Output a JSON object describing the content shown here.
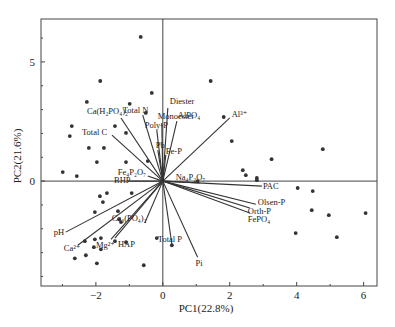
{
  "chart_data": {
    "type": "scatter",
    "subtype": "pca-biplot",
    "title": "",
    "xlabel": "PC1(22.8%)",
    "ylabel": "PC2(21.6%)",
    "xlim": [
      -3.64,
      6.4
    ],
    "ylim": [
      -4.4,
      6.8
    ],
    "x_ticks": [
      -2,
      0,
      2,
      4,
      6
    ],
    "y_ticks": [
      0,
      5
    ],
    "grid": false,
    "legend": "none",
    "reference_lines": {
      "x": 0,
      "y": 0
    },
    "points": [
      [
        -0.66,
        6.05
      ],
      [
        -1.87,
        4.2
      ],
      [
        -0.33,
        3.7
      ],
      [
        -2.27,
        3.32
      ],
      [
        -0.99,
        3.24
      ],
      [
        -2.72,
        2.31
      ],
      [
        -2.78,
        1.89
      ],
      [
        -1.43,
        2.31
      ],
      [
        -0.51,
        2.86
      ],
      [
        -2.21,
        1.39
      ],
      [
        -1.76,
        1.39
      ],
      [
        -1.97,
        0.8
      ],
      [
        -1.1,
        0.8
      ],
      [
        -2.99,
        0.38
      ],
      [
        -2.57,
        0.21
      ],
      [
        -1.1,
        2.02
      ],
      [
        -0.45,
        0.84
      ],
      [
        1.43,
        4.2
      ],
      [
        1.82,
        2.69
      ],
      [
        2.06,
        1.68
      ],
      [
        3.25,
        0.92
      ],
      [
        4.78,
        1.34
      ],
      [
        2.39,
        0.46
      ],
      [
        2.48,
        0.25
      ],
      [
        2.81,
        0.13
      ],
      [
        2.81,
        0.04
      ],
      [
        1.04,
        0.0
      ],
      [
        -1.88,
        -0.63
      ],
      [
        -1.67,
        -0.5
      ],
      [
        -1.79,
        -0.88
      ],
      [
        -0.93,
        -0.5
      ],
      [
        -2.03,
        -1.3
      ],
      [
        -1.34,
        -1.26
      ],
      [
        -1.31,
        -1.6
      ],
      [
        -1.25,
        -1.72
      ],
      [
        -2.33,
        -2.52
      ],
      [
        -2.03,
        -2.44
      ],
      [
        -1.85,
        -2.39
      ],
      [
        -2.06,
        -2.77
      ],
      [
        -1.85,
        -2.86
      ],
      [
        -1.43,
        -2.52
      ],
      [
        -1.1,
        -2.56
      ],
      [
        -2.63,
        -3.24
      ],
      [
        -2.3,
        -3.11
      ],
      [
        -1.97,
        -3.45
      ],
      [
        -0.57,
        -3.53
      ],
      [
        -0.18,
        -2.39
      ],
      [
        4.03,
        -0.29
      ],
      [
        4.48,
        -0.42
      ],
      [
        4.45,
        -1.22
      ],
      [
        4.96,
        -1.43
      ],
      [
        6.06,
        -1.34
      ],
      [
        3.97,
        -2.18
      ],
      [
        5.2,
        -2.35
      ],
      [
        0.27,
        -2.69
      ]
    ],
    "loadings": [
      {
        "label": "Diester",
        "x": 0.15,
        "y": 3.07
      },
      {
        "label": "Monoester",
        "x": -0.03,
        "y": 2.44
      },
      {
        "label": "Poly-P",
        "x": -0.18,
        "y": 2.14
      },
      {
        "label": "Total N",
        "x": -0.6,
        "y": 2.77
      },
      {
        "label": "Ca(H₂PO₄)₂",
        "x": -1.25,
        "y": 2.65
      },
      {
        "label": "Total C",
        "x": -1.52,
        "y": 1.93
      },
      {
        "label": "AlPO₄",
        "x": 0.42,
        "y": 2.52
      },
      {
        "label": "Pb",
        "x": -0.15,
        "y": 1.3
      },
      {
        "label": "Fe-P",
        "x": 0.09,
        "y": 1.1
      },
      {
        "label": "Al³⁺",
        "x": 2.0,
        "y": 2.65
      },
      {
        "label": "Fe₄P₂O₇",
        "x": -0.45,
        "y": 0.21
      },
      {
        "label": "BHP",
        "x": -1.04,
        "y": 0.0
      },
      {
        "label": "Na₄P₂O₇",
        "x": 1.1,
        "y": -0.08
      },
      {
        "label": "PAC",
        "x": 2.96,
        "y": -0.21
      },
      {
        "label": "Olsen-P",
        "x": 2.78,
        "y": -0.97
      },
      {
        "label": "Orth-P",
        "x": 2.6,
        "y": -1.13
      },
      {
        "label": "FePO₄",
        "x": 2.6,
        "y": -1.34
      },
      {
        "label": "Pi",
        "x": 1.04,
        "y": -3.19
      },
      {
        "label": "Total P",
        "x": 0.27,
        "y": -2.65
      },
      {
        "label": "HAP",
        "x": -1.43,
        "y": -2.39
      },
      {
        "label": "Mg²⁺",
        "x": -1.55,
        "y": -2.44
      },
      {
        "label": "Ca₃(PO₄)₂",
        "x": -0.54,
        "y": -1.76
      },
      {
        "label": "pH",
        "x": -2.9,
        "y": -2.14
      },
      {
        "label": "Ca²⁺",
        "x": -2.54,
        "y": -2.69
      }
    ]
  },
  "labels_layout": {
    "Diester": {
      "dx": 2,
      "dy": -4,
      "anchor": "start"
    },
    "Monoester": {
      "dx": -4,
      "dy": -4,
      "anchor": "start"
    },
    "Poly-P": {
      "dx": -12,
      "dy": -2,
      "anchor": "start"
    },
    "Total N": {
      "dx": -20,
      "dy": -2,
      "anchor": "start"
    },
    "Ca(H₂PO₄)₂": {
      "dx": -34,
      "dy": -4,
      "anchor": "start"
    },
    "Total C": {
      "dx": -30,
      "dy": 0,
      "anchor": "start"
    },
    "AlPO₄": {
      "dx": 1,
      "dy": -3,
      "anchor": "start"
    },
    "Pb": {
      "dx": -2,
      "dy": -2,
      "anchor": "start"
    },
    "Fe-P": {
      "dx": 0,
      "dy": -1,
      "anchor": "start"
    },
    "Al³⁺": {
      "dx": 2,
      "dy": -1,
      "anchor": "start"
    },
    "Fe₄P₂O₇": {
      "dx": -30,
      "dy": -1,
      "anchor": "start"
    },
    "BHP": {
      "dx": -14,
      "dy": 2,
      "anchor": "start"
    },
    "Na₄P₂O₇": {
      "dx": -24,
      "dy": -3,
      "anchor": "start"
    },
    "PAC": {
      "dx": 1,
      "dy": 3,
      "anchor": "start"
    },
    "Olsen-P": {
      "dx": 2,
      "dy": 1,
      "anchor": "start"
    },
    "Orth-P": {
      "dx": -2,
      "dy": 6,
      "anchor": "start"
    },
    "FePO₄": {
      "dx": -2,
      "dy": 9,
      "anchor": "start"
    },
    "Pi": {
      "dx": -2,
      "dy": 9,
      "anchor": "start"
    },
    "Total P": {
      "dx": -14,
      "dy": -2,
      "anchor": "start"
    },
    "HAP": {
      "dx": 3,
      "dy": 9,
      "anchor": "start"
    },
    "Mg²⁺": {
      "dx": -15,
      "dy": 9,
      "anchor": "start"
    },
    "Ca₃(PO₄)₂": {
      "dx": -33,
      "dy": -2,
      "anchor": "start"
    },
    "pH": {
      "dx": -12,
      "dy": 3,
      "anchor": "start"
    },
    "Ca²⁺": {
      "dx": -14,
      "dy": 6,
      "anchor": "start"
    }
  },
  "style": {
    "frame_color": "#444444",
    "arrow_color": "#333333",
    "point_color": "#333333",
    "background": "#ffffff"
  }
}
